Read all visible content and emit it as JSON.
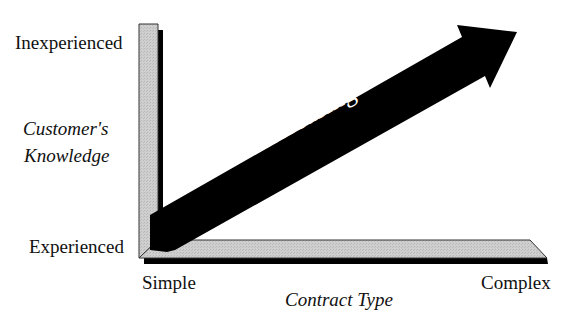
{
  "diagram": {
    "y_axis": {
      "title_line1": "Customer's",
      "title_line2": "Knowledge",
      "top_label": "Inexperienced",
      "bottom_label": "Experienced"
    },
    "x_axis": {
      "title": "Contract Type",
      "left_label": "Simple",
      "right_label": "Complex"
    },
    "arrow_label": "Increasing",
    "colors": {
      "bar_fill": "#c8c8c8",
      "shadow": "#000000",
      "arrow": "#000000",
      "arrow_text": "#ffffff"
    }
  }
}
